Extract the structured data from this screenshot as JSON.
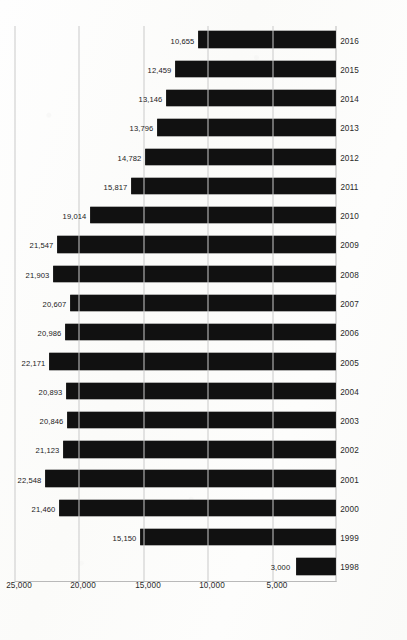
{
  "chart_data": {
    "type": "bar",
    "orientation": "horizontal-scan-rotated",
    "title": "",
    "subtitle": "",
    "xlabel": "",
    "ylabel": "",
    "categories": [
      "1998",
      "1999",
      "2000",
      "2001",
      "2002",
      "2003",
      "2004",
      "2005",
      "2006",
      "2007",
      "2008",
      "2009",
      "2010",
      "2011",
      "2012",
      "2013",
      "2014",
      "2015",
      "2016"
    ],
    "values": [
      3000,
      15150,
      21460,
      22548,
      21123,
      20846,
      20893,
      22171,
      20986,
      20607,
      21903,
      21547,
      19014,
      15817,
      14782,
      13796,
      13146,
      12459,
      10655
    ],
    "data_labels": [
      "3,000",
      "15,150",
      "21,460",
      "22,548",
      "21,123",
      "20,846",
      "20,893",
      "22,171",
      "20,986",
      "20,607",
      "21,903",
      "21,547",
      "19,014",
      "15,817",
      "14,782",
      "13,796",
      "13,146",
      "12,459",
      "10,655"
    ],
    "value_axis_ticks": [
      0,
      5000,
      10000,
      15000,
      20000,
      25000
    ],
    "value_axis_tick_labels": [
      "",
      "5,000",
      "10,000",
      "15,000",
      "20,000",
      "25,000"
    ],
    "ylim": [
      0,
      25000
    ],
    "grid": true,
    "legend": "none",
    "bar_color": "#111111",
    "gridline_color": "#c9c9c9",
    "axis_color": "#b9b9b9",
    "background_color": "#fdfdfb",
    "label_color": "#2a2a2a"
  }
}
